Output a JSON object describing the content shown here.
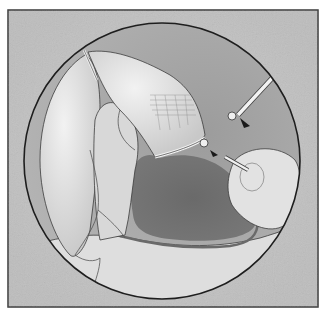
{
  "figure": {
    "kind": "medical-illustration",
    "style": "grayscale pencil rendering",
    "text_labels": []
  },
  "frame": {
    "border_color": "#3a3a3a",
    "background_color": "#c4c4c4",
    "x": 8,
    "y": 10,
    "width": 310,
    "height": 297
  },
  "view_circle": {
    "cx": 162,
    "cy": 161,
    "r": 138,
    "outline_color": "#1e1e1e",
    "interior_color": "#a4a4a4"
  },
  "colors": {
    "tissue_light": "#e6e6e6",
    "tissue_mid": "#d2d2d2",
    "tissue_shadow": "#b8b8b8",
    "cavity_dark": "#6e6e6e",
    "outline": "#3c3c3c",
    "vessel": "#555555",
    "instrument": "#f0f0f0",
    "instrument_tip": "#1a1a1a",
    "page_background": "#ffffff"
  },
  "instruments": [
    {
      "name": "upper-right-probe",
      "description": "angled probe entering from upper right"
    },
    {
      "name": "clip-tip",
      "description": "small metal clip on tissue edge"
    },
    {
      "name": "right-catheter",
      "description": "cylindrical instrument from right with inserted rod"
    }
  ]
}
